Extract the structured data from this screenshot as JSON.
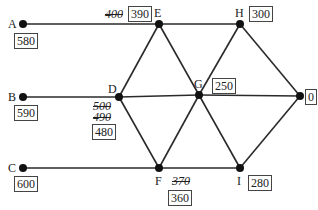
{
  "diagram": {
    "type": "network-graph",
    "nodes": [
      {
        "id": "A",
        "label": "A",
        "x": 23,
        "y": 24,
        "value": "580",
        "struck": []
      },
      {
        "id": "B",
        "label": "B",
        "x": 23,
        "y": 97,
        "value": "590",
        "struck": []
      },
      {
        "id": "C",
        "label": "C",
        "x": 23,
        "y": 168,
        "value": "600",
        "struck": []
      },
      {
        "id": "D",
        "label": "D",
        "x": 119,
        "y": 97,
        "value": "480",
        "struck": [
          "500",
          "490"
        ]
      },
      {
        "id": "E",
        "label": "E",
        "x": 159,
        "y": 24,
        "value": "390",
        "struck": [
          "400"
        ]
      },
      {
        "id": "F",
        "label": "F",
        "x": 159,
        "y": 168,
        "value": "360",
        "struck": [
          "370"
        ]
      },
      {
        "id": "G",
        "label": "G",
        "x": 199,
        "y": 95,
        "value": "250",
        "struck": []
      },
      {
        "id": "H",
        "label": "H",
        "x": 240,
        "y": 24,
        "value": "300",
        "struck": []
      },
      {
        "id": "I",
        "label": "I",
        "x": 240,
        "y": 168,
        "value": "280",
        "struck": []
      },
      {
        "id": "J",
        "label": "J",
        "x": 300,
        "y": 96,
        "value": "0",
        "struck": []
      }
    ],
    "edges": [
      [
        "A",
        "E"
      ],
      [
        "E",
        "H"
      ],
      [
        "E",
        "D"
      ],
      [
        "E",
        "G"
      ],
      [
        "H",
        "G"
      ],
      [
        "H",
        "J"
      ],
      [
        "B",
        "D"
      ],
      [
        "D",
        "G"
      ],
      [
        "G",
        "J"
      ],
      [
        "D",
        "F"
      ],
      [
        "G",
        "F"
      ],
      [
        "G",
        "I"
      ],
      [
        "J",
        "I"
      ],
      [
        "C",
        "F"
      ],
      [
        "F",
        "I"
      ]
    ],
    "colors": {
      "line": "#2a2a2a",
      "node": "#111111",
      "box_border": "#444444"
    }
  },
  "labels": {
    "A": "A",
    "B": "B",
    "C": "C",
    "D": "D",
    "E": "E",
    "F": "F",
    "G": "G",
    "H": "H",
    "I": "I",
    "J": "J"
  },
  "values": {
    "A": "580",
    "B": "590",
    "C": "600",
    "D": "480",
    "E": "390",
    "F": "360",
    "G": "250",
    "H": "300",
    "I": "280",
    "J": "0"
  },
  "struck_values": {
    "D_1": "500",
    "D_2": "490",
    "E_1": "400",
    "F_1": "370"
  }
}
